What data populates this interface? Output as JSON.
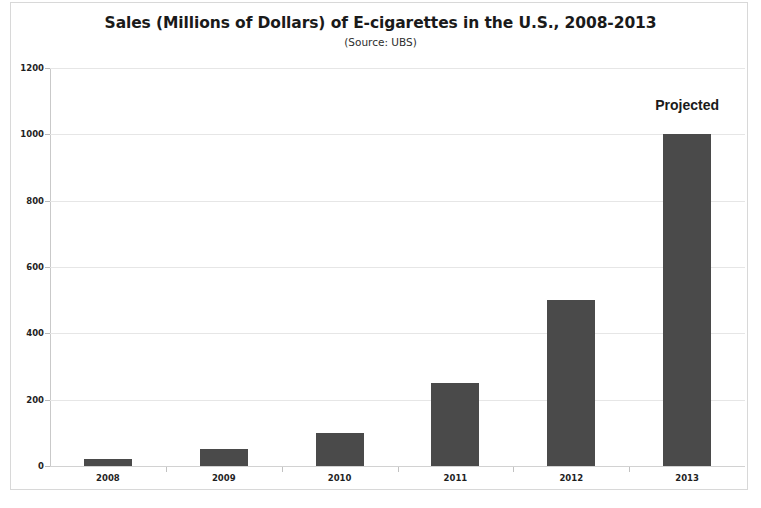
{
  "chart_data": {
    "type": "bar",
    "title": "Sales (Millions of Dollars) of E-cigarettes in the U.S., 2008-2013",
    "subtitle": "(Source: UBS)",
    "xlabel": "",
    "ylabel": "",
    "categories": [
      "2008",
      "2009",
      "2010",
      "2011",
      "2012",
      "2013"
    ],
    "values": [
      20,
      50,
      100,
      250,
      500,
      1000
    ],
    "ylim": [
      0,
      1200
    ],
    "yticks": [
      0,
      200,
      400,
      600,
      800,
      1000,
      1200
    ],
    "ytick_labels": [
      "0",
      "200",
      "400",
      "600",
      "800",
      "1000",
      "1200"
    ],
    "grid": true,
    "legend": false,
    "legend_position": "none",
    "bar_color": "#4a4a4a",
    "gridline_color": "#e6e6e6",
    "axis_color": "#c9c9c9",
    "background_color": "#ffffff",
    "annotations": [
      {
        "text": "Projected",
        "category": "2013",
        "value": 1000
      }
    ]
  }
}
